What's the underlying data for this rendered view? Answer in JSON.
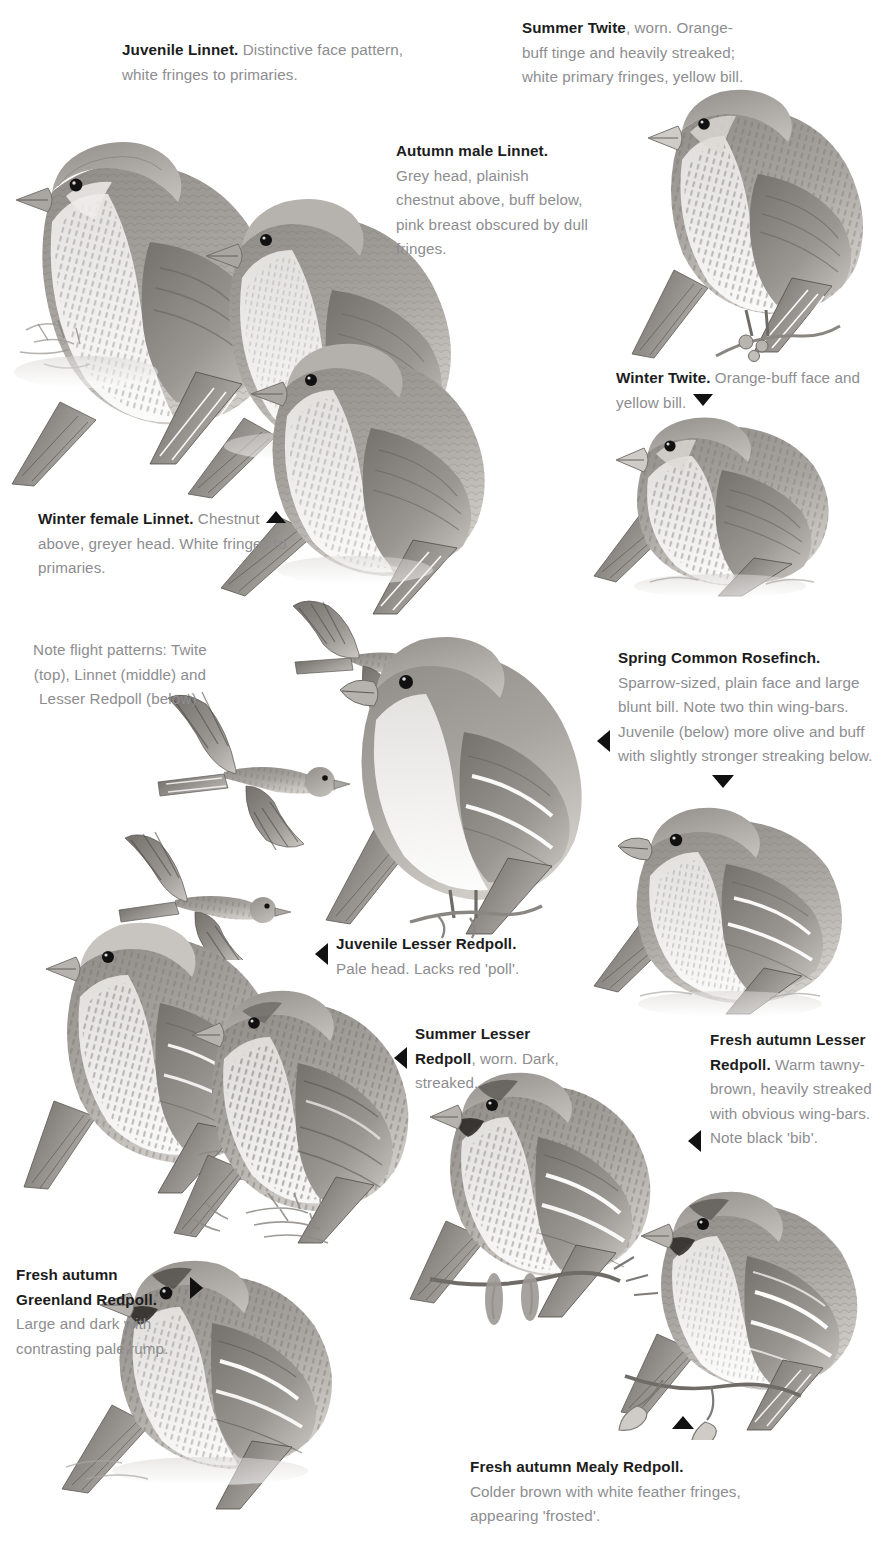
{
  "page": {
    "type": "field-guide-plate",
    "background_color": "#ffffff",
    "text_color_body": "#8d8d90",
    "text_color_lead": "#1c1c1c",
    "pointer_color": "#111111"
  },
  "captions": {
    "juvenile_linnet": {
      "lead": "Juvenile Linnet.",
      "body": " Distinctive face pattern, white fringes to primaries."
    },
    "summer_twite": {
      "lead": "Summer Twite",
      "body": ", worn. Orange-buff tinge and heavily streaked; white primary fringes, yellow bill."
    },
    "autumn_male_linnet": {
      "lead": "Autumn male Linnet.",
      "body": "Grey head, plainish chestnut above, buff below, pink breast obscured by dull fringes."
    },
    "winter_twite": {
      "lead": "Winter Twite.",
      "body": " Orange-buff face and yellow bill."
    },
    "winter_female_linnet": {
      "lead": "Winter female Linnet.",
      "body_first": " Chestnut",
      "body_rest": "above, greyer head. White fringes to primaries."
    },
    "flight_note": {
      "body": "Note flight patterns: Twite (top), Linnet (middle) and Lesser Redpoll (below)."
    },
    "spring_common_rosefinch": {
      "lead": "Spring Common Rosefinch.",
      "body": "Sparrow-sized, plain face and large blunt bill. Note two thin wing-bars. Juvenile (below) more olive and buff with slightly stronger streaking below."
    },
    "juvenile_lesser_redpoll": {
      "lead": "Juvenile Lesser Redpoll.",
      "body": "Pale head. Lacks red 'poll'."
    },
    "summer_lesser_redpoll": {
      "lead": "Summer Lesser Redpoll",
      "body": ", worn. Dark, streaked."
    },
    "fresh_autumn_lesser_redpoll": {
      "lead": "Fresh autumn Lesser Redpoll.",
      "body": " Warm tawny-brown, heavily streaked with obvious wing-bars. Note black 'bib'."
    },
    "fresh_autumn_greenland_redpoll": {
      "lead": "Fresh autumn Greenland Redpoll.",
      "body": "Large and dark with contrasting pale rump."
    },
    "fresh_autumn_mealy_redpoll": {
      "lead": "Fresh autumn Mealy Redpoll.",
      "body": "Colder brown with white feather fringes, appearing 'frosted'."
    }
  },
  "pointers": [
    {
      "name": "winter-twite-pointer",
      "direction": "down"
    },
    {
      "name": "winter-female-linnet-pointer",
      "direction": "up"
    },
    {
      "name": "rosefinch-left-pointer",
      "direction": "left"
    },
    {
      "name": "rosefinch-juvenile-pointer",
      "direction": "down"
    },
    {
      "name": "juvenile-lesser-redpoll-pointer",
      "direction": "left"
    },
    {
      "name": "summer-lesser-redpoll-pointer",
      "direction": "left"
    },
    {
      "name": "fresh-autumn-lesser-redpoll-pointer",
      "direction": "left"
    },
    {
      "name": "greenland-redpoll-pointer",
      "direction": "right"
    },
    {
      "name": "mealy-redpoll-pointer",
      "direction": "up"
    }
  ],
  "illustrations": [
    {
      "name": "juvenile-linnet-illustration",
      "label": "Juvenile Linnet perched on ground"
    },
    {
      "name": "autumn-male-linnet-illustration",
      "label": "Autumn male Linnet perched"
    },
    {
      "name": "summer-twite-illustration",
      "label": "Summer Twite perched on twig"
    },
    {
      "name": "winter-female-linnet-illustration",
      "label": "Winter female Linnet perched"
    },
    {
      "name": "winter-twite-illustration",
      "label": "Winter Twite on ground"
    },
    {
      "name": "twite-flight-illustration",
      "label": "Twite in flight"
    },
    {
      "name": "linnet-flight-illustration",
      "label": "Linnet in flight"
    },
    {
      "name": "lesser-redpoll-flight-illustration",
      "label": "Lesser Redpoll in flight"
    },
    {
      "name": "spring-common-rosefinch-illustration",
      "label": "Spring Common Rosefinch on perch"
    },
    {
      "name": "juvenile-rosefinch-illustration",
      "label": "Juvenile Common Rosefinch on ground"
    },
    {
      "name": "juvenile-lesser-redpoll-illustration",
      "label": "Juvenile Lesser Redpoll perched"
    },
    {
      "name": "summer-lesser-redpoll-illustration",
      "label": "Summer Lesser Redpoll on conifer spray"
    },
    {
      "name": "fresh-autumn-lesser-redpoll-illustration",
      "label": "Fresh autumn Lesser Redpoll on alder"
    },
    {
      "name": "fresh-autumn-mealy-redpoll-illustration",
      "label": "Fresh autumn Mealy Redpoll on birch"
    },
    {
      "name": "fresh-autumn-greenland-redpoll-illustration",
      "label": "Fresh autumn Greenland Redpoll on ground"
    }
  ]
}
